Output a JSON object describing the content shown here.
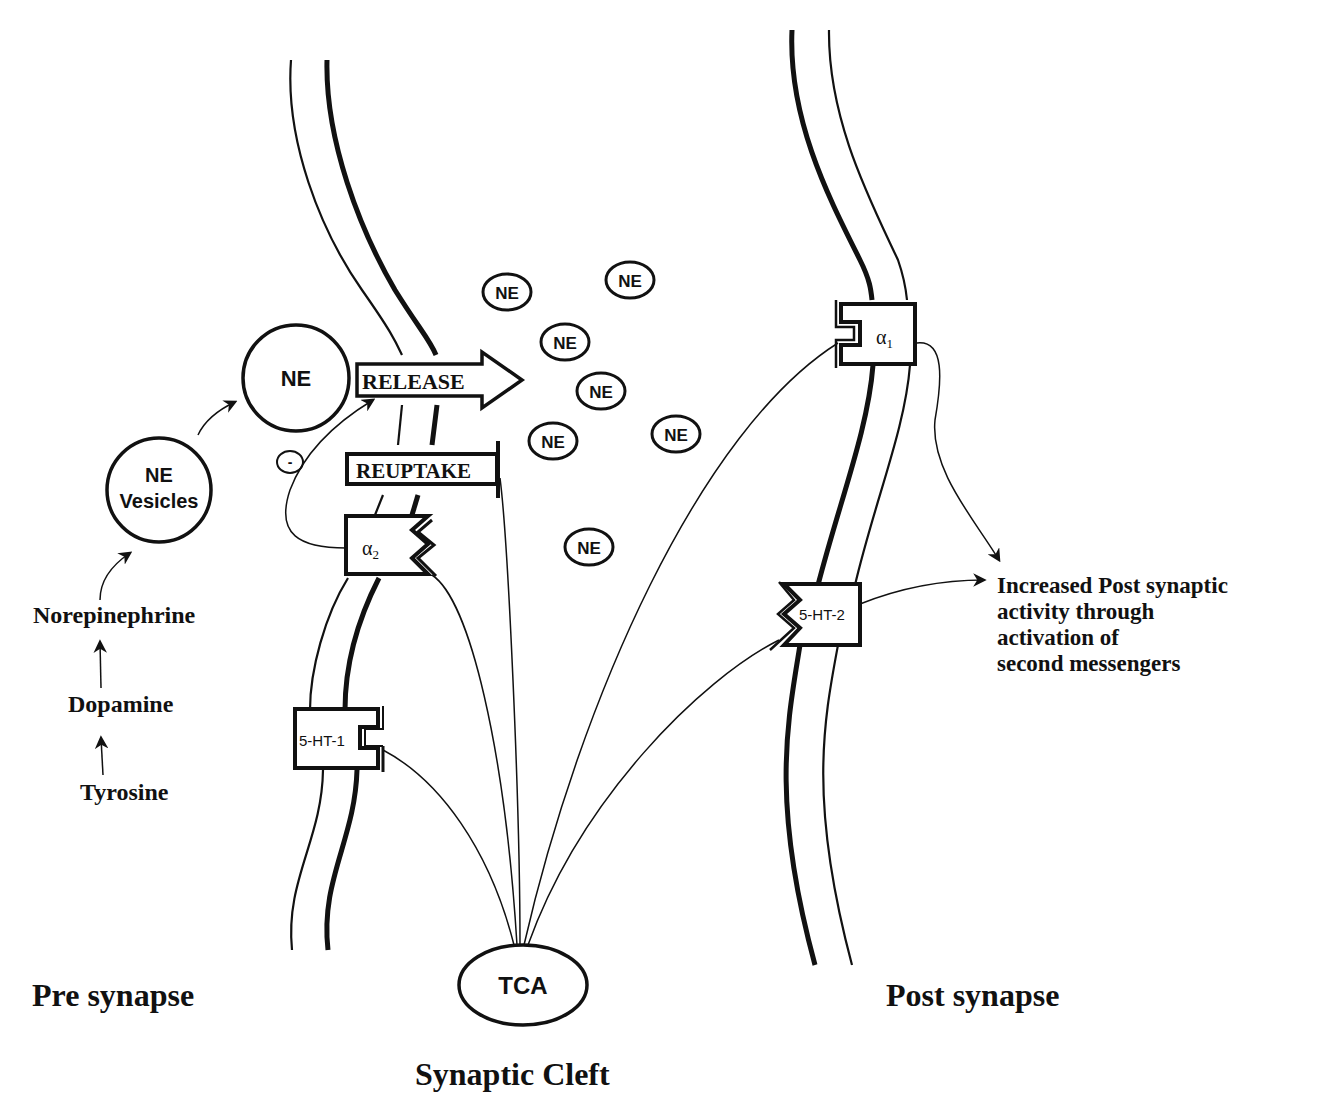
{
  "diagram": {
    "regions": {
      "pre_synapse": "Pre synapse",
      "synaptic_cleft": "Synaptic Cleft",
      "post_synapse": "Post synapse"
    },
    "synthesis_pathway": {
      "steps": [
        "Tyrosine",
        "Dopamine",
        "Norepinephrine"
      ],
      "vesicles_line1": "NE",
      "vesicles_line2": "Vesicles",
      "ne_pool": "NE"
    },
    "inhibition_sign": "-",
    "processes": {
      "release": "RELEASE",
      "reuptake": "REUPTAKE"
    },
    "receptors": {
      "alpha2": {
        "symbol": "α",
        "subscript": "2"
      },
      "ht1": "5-HT-1",
      "alpha1": {
        "symbol": "α",
        "subscript": "1"
      },
      "ht2": "5-HT-2"
    },
    "cleft_molecules": [
      "NE",
      "NE",
      "NE",
      "NE",
      "NE",
      "NE",
      "NE"
    ],
    "drug": "TCA",
    "outcome": {
      "line1": "Increased Post synaptic",
      "line2": "activity through",
      "line3": "activation of",
      "line4": "second messengers"
    }
  }
}
